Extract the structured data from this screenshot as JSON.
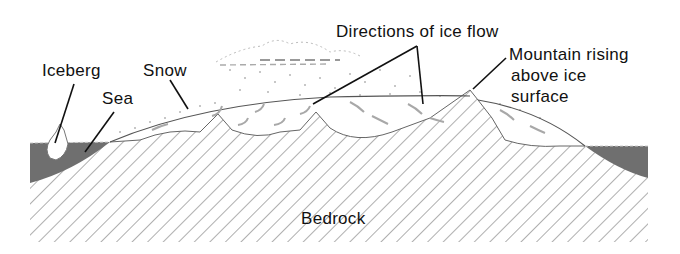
{
  "diagram": {
    "type": "cross-section",
    "labels": {
      "iceberg": "Iceberg",
      "sea": "Sea",
      "snow": "Snow",
      "ice_flow": "Directions of ice flow",
      "mountain_line1": "Mountain rising",
      "mountain_line2": "above ice",
      "mountain_line3": "surface",
      "bedrock": "Bedrock"
    },
    "colors": {
      "sea": "#6f6f6f",
      "hatch": "#9a9a9a",
      "outline": "#555555",
      "leader": "#111111",
      "arrows": "#a8a8a8"
    }
  }
}
